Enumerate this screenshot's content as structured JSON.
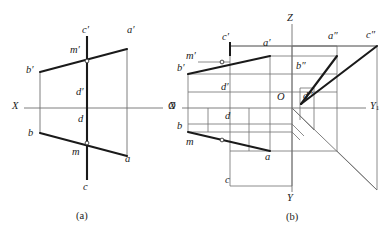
{
  "figure": {
    "background_color": "#ffffff",
    "ink_color": "#1a1a1a",
    "thin_color": "#6f6f6f",
    "captions": [
      {
        "id": "caption-a",
        "text": "(a)",
        "x": 82,
        "y": 216
      },
      {
        "id": "caption-b",
        "text": "(b)",
        "x": 292,
        "y": 217
      }
    ]
  },
  "diagram_a": {
    "name": "two-view-projection",
    "axis_labels": [
      {
        "id": "axis-x",
        "text": "X",
        "x": 12,
        "y": 104,
        "italic": true
      },
      {
        "id": "axis-o",
        "text": "O",
        "x": 170,
        "y": 104,
        "italic": true
      }
    ],
    "point_labels": [
      {
        "id": "label-c-prime",
        "text": "c′",
        "x": 82,
        "y": 28
      },
      {
        "id": "label-a-prime",
        "text": "a′",
        "x": 128,
        "y": 28
      },
      {
        "id": "label-m-prime",
        "text": "m′",
        "x": 72,
        "y": 48
      },
      {
        "id": "label-b-prime",
        "text": "b′",
        "x": 27,
        "y": 68
      },
      {
        "id": "label-d-prime",
        "text": "d′",
        "x": 76,
        "y": 90
      },
      {
        "id": "label-d",
        "text": "d",
        "x": 77,
        "y": 117
      },
      {
        "id": "label-b",
        "text": "b",
        "x": 28,
        "y": 131
      },
      {
        "id": "label-m",
        "text": "m",
        "x": 74,
        "y": 150
      },
      {
        "id": "label-a",
        "text": "a",
        "x": 126,
        "y": 157
      },
      {
        "id": "label-c",
        "text": "c",
        "x": 82,
        "y": 185
      }
    ]
  },
  "diagram_b": {
    "name": "three-view-projection",
    "axis_labels": [
      {
        "id": "axis-z",
        "text": "Z",
        "x": 288,
        "y": 16
      },
      {
        "id": "axis-x-b",
        "text": "X",
        "x": 170,
        "y": 104
      },
      {
        "id": "axis-y1",
        "text": "Y",
        "sub": "1",
        "x": 372,
        "y": 104
      },
      {
        "id": "axis-y",
        "text": "Y",
        "x": 288,
        "y": 196
      }
    ],
    "point_labels": [
      {
        "id": "label-c-prime-b",
        "text": "c′",
        "x": 224,
        "y": 35
      },
      {
        "id": "label-a-prime-b",
        "text": "a′",
        "x": 265,
        "y": 40
      },
      {
        "id": "label-a-dprime",
        "text": "a″",
        "x": 330,
        "y": 33
      },
      {
        "id": "label-c-dprime",
        "text": "c″",
        "x": 368,
        "y": 32
      },
      {
        "id": "label-m-prime-b",
        "text": "m′",
        "x": 188,
        "y": 54
      },
      {
        "id": "label-b-prime-b",
        "text": "b′",
        "x": 178,
        "y": 66
      },
      {
        "id": "label-b-dprime",
        "text": "b″",
        "x": 297,
        "y": 63
      },
      {
        "id": "label-d-prime-b",
        "text": "d′",
        "x": 222,
        "y": 85
      },
      {
        "id": "label-o-b",
        "text": "O",
        "x": 278,
        "y": 94
      },
      {
        "id": "label-d-dprime",
        "text": "d″",
        "x": 304,
        "y": 94
      },
      {
        "id": "label-d-b",
        "text": "d",
        "x": 224,
        "y": 114
      },
      {
        "id": "label-b-b",
        "text": "b",
        "x": 178,
        "y": 124
      },
      {
        "id": "label-m-b",
        "text": "m",
        "x": 188,
        "y": 140
      },
      {
        "id": "label-a-b",
        "text": "a",
        "x": 266,
        "y": 155
      },
      {
        "id": "label-c-b",
        "text": "c",
        "x": 224,
        "y": 178
      }
    ]
  }
}
